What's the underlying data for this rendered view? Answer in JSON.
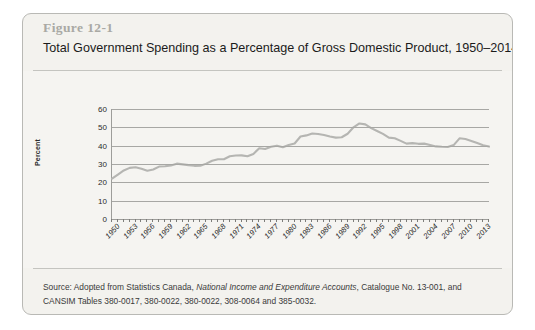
{
  "figure": {
    "number_label": "Figure 12-1",
    "title": "Total Government Spending as a Percentage of Gross Domestic Product, 1950–2014",
    "source_prefix": "Source: Adopted from Statistics Canada, ",
    "source_italic": "National Income and Expenditure Accounts",
    "source_suffix": ", Catalogue No. 13-001, and",
    "source_line2": "CANSIM Tables 380-0017, 380-0022, 380-0022, 308-0064 and 385-0032.",
    "colors": {
      "card_background": "#f3f2ee",
      "card_border": "#b9b9b5",
      "figure_number": "#a9a9a4",
      "line": "#b5b5b2",
      "gridline": "#a7a7a4",
      "axis": "#9d9d9a"
    }
  },
  "chart_data": {
    "type": "line",
    "title": "Total Government Spending as a Percentage of Gross Domestic Product, 1950–2014",
    "xlabel": "",
    "ylabel": "Percent",
    "ylim": [
      0,
      60
    ],
    "yticks": [
      0,
      10,
      20,
      30,
      40,
      50,
      60
    ],
    "xlim": [
      1950,
      2014
    ],
    "xticks": [
      1950,
      1953,
      1956,
      1959,
      1962,
      1965,
      1968,
      1971,
      1974,
      1977,
      1980,
      1983,
      1986,
      1989,
      1992,
      1995,
      1998,
      2001,
      2004,
      2007,
      2010,
      2013
    ],
    "xtick_labels": [
      "1950",
      "1953",
      "1956",
      "1959",
      "1962",
      "1965",
      "1968",
      "1971",
      "1974",
      "1977",
      "1980",
      "1983",
      "1986",
      "1989",
      "1992",
      "1995",
      "1998",
      "2001",
      "2004",
      "2007",
      "2010",
      "2013"
    ],
    "grid": true,
    "legend": false,
    "series": [
      {
        "name": "Total Government Spending (% of GDP)",
        "x": [
          1950,
          1951,
          1952,
          1953,
          1954,
          1955,
          1956,
          1957,
          1958,
          1959,
          1960,
          1961,
          1962,
          1963,
          1964,
          1965,
          1966,
          1967,
          1968,
          1969,
          1970,
          1971,
          1972,
          1973,
          1974,
          1975,
          1976,
          1977,
          1978,
          1979,
          1980,
          1981,
          1982,
          1983,
          1984,
          1985,
          1986,
          1987,
          1988,
          1989,
          1990,
          1991,
          1992,
          1993,
          1994,
          1995,
          1996,
          1997,
          1998,
          1999,
          2000,
          2001,
          2002,
          2003,
          2004,
          2005,
          2006,
          2007,
          2008,
          2009,
          2010,
          2011,
          2012,
          2013,
          2014
        ],
        "values": [
          22.0,
          24.2,
          26.5,
          27.9,
          28.2,
          27.4,
          26.3,
          27.0,
          28.6,
          28.8,
          29.2,
          30.2,
          29.8,
          29.4,
          29.0,
          29.1,
          30.2,
          31.8,
          32.6,
          32.6,
          34.2,
          34.6,
          34.7,
          34.2,
          35.5,
          38.6,
          38.2,
          39.4,
          40.0,
          39.1,
          40.4,
          41.2,
          45.0,
          45.6,
          46.6,
          46.4,
          45.8,
          45.0,
          44.4,
          44.6,
          46.5,
          50.0,
          52.1,
          51.6,
          49.6,
          48.0,
          46.4,
          44.4,
          44.0,
          42.6,
          41.1,
          41.4,
          41.0,
          41.1,
          40.4,
          39.6,
          39.4,
          39.3,
          40.3,
          44.0,
          43.6,
          42.6,
          41.4,
          40.2,
          39.5
        ]
      }
    ]
  }
}
